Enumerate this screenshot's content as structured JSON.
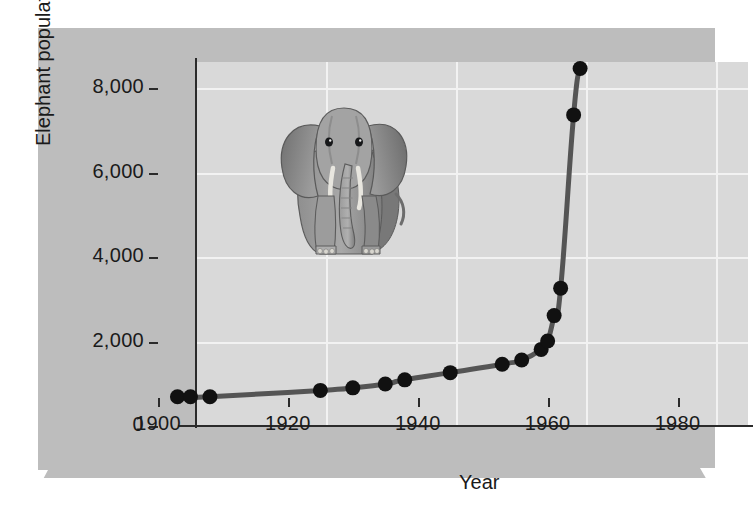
{
  "chart_data": {
    "type": "line",
    "title": "",
    "xlabel": "Year",
    "ylabel": "Elephant population",
    "xlim": [
      1900,
      1985
    ],
    "ylim": [
      0,
      8400
    ],
    "grid": true,
    "legend": "none",
    "x_ticks": [
      "1900",
      "1920",
      "1940",
      "1960",
      "1980"
    ],
    "x_tick_values": [
      1900,
      1920,
      1940,
      1960,
      1980
    ],
    "y_ticks": [
      "0",
      "2,000",
      "4,000",
      "6,000",
      "8,000"
    ],
    "y_tick_values": [
      0,
      2000,
      4000,
      6000,
      8000
    ],
    "series": [
      {
        "name": "Elephant population",
        "marker": "filled-circle",
        "marker_color": "#111111",
        "line_color": "#555555",
        "x": [
          1903,
          1905,
          1908,
          1925,
          1930,
          1935,
          1938,
          1945,
          1953,
          1956,
          1959,
          1960,
          1961,
          1962,
          1964,
          1965
        ],
        "y": [
          30,
          30,
          30,
          180,
          240,
          330,
          430,
          600,
          800,
          900,
          1150,
          1350,
          1950,
          2600,
          6700,
          7800
        ]
      }
    ],
    "annotations": [
      {
        "name": "elephant-illustration",
        "type": "image",
        "description": "front-facing African elephant"
      }
    ]
  },
  "axes": {
    "y_title": "Elephant population",
    "x_title": "Year"
  },
  "colors": {
    "figure_background": "#bdbdbd",
    "plot_background": "#d9d9d9",
    "gridline": "#f2f2f2",
    "axis": "#2b2b2b",
    "curve": "#555555",
    "marker": "#111111",
    "page_background": "#ffffff"
  }
}
